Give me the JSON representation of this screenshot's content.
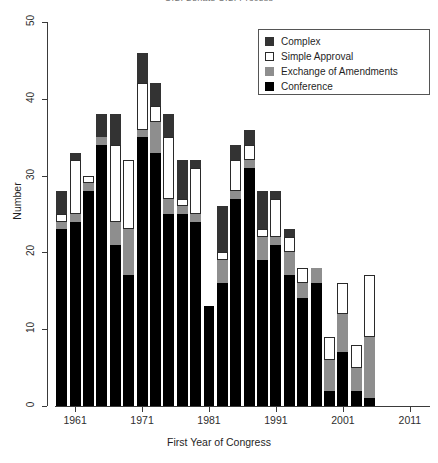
{
  "chart_data": {
    "type": "bar",
    "stacked": true,
    "title": "U.S. Senate U.S. Process",
    "xlabel": "First Year of Congress",
    "ylabel": "Number",
    "ylim": [
      0,
      50
    ],
    "yticks": [
      0,
      10,
      20,
      30,
      40,
      50
    ],
    "xticks": [
      1961,
      1971,
      1981,
      1991,
      2001,
      2011
    ],
    "grid": false,
    "legend_position": "top-right",
    "categories": [
      1959,
      1961,
      1963,
      1965,
      1967,
      1969,
      1971,
      1973,
      1975,
      1977,
      1979,
      1981,
      1983,
      1985,
      1987,
      1989,
      1991,
      1993,
      1995,
      1997,
      1999,
      2001,
      2003,
      2005,
      2007,
      2009,
      2011,
      2013
    ],
    "series": [
      {
        "name": "Conference",
        "color": "#000000",
        "values": [
          23,
          24,
          28,
          34,
          21,
          17,
          35,
          33,
          25,
          25,
          24,
          13,
          16,
          27,
          31,
          19,
          21,
          17,
          14,
          16,
          2,
          7,
          2,
          1,
          0,
          0,
          0,
          0
        ]
      },
      {
        "name": "Exchange of Amendments",
        "color": "#8e8e8e",
        "values": [
          1,
          1,
          1,
          1,
          3,
          6,
          1,
          4,
          2,
          1,
          1,
          0,
          3,
          1,
          1,
          3,
          1,
          3,
          2,
          2,
          4,
          5,
          3,
          8,
          0,
          0,
          0,
          0
        ]
      },
      {
        "name": "Simple Approval",
        "color": "#ffffff",
        "values": [
          1,
          7,
          1,
          0,
          10,
          9,
          6,
          2,
          8,
          1,
          6,
          0,
          1,
          4,
          2,
          1,
          5,
          2,
          2,
          0,
          3,
          4,
          3,
          8,
          0,
          0,
          0,
          0
        ]
      },
      {
        "name": "Complex",
        "color": "#333333",
        "values": [
          3,
          1,
          0,
          3,
          4,
          0,
          4,
          3,
          3,
          5,
          1,
          0,
          6,
          2,
          2,
          5,
          1,
          1,
          0,
          0,
          0,
          0,
          0,
          0,
          0,
          0,
          0,
          0
        ]
      }
    ],
    "totals": [
      28,
      33,
      30,
      38,
      38,
      32,
      46,
      42,
      38,
      32,
      32,
      13,
      26,
      34,
      36,
      28,
      28,
      23,
      18,
      18,
      9,
      16,
      8,
      17,
      0,
      0,
      0,
      0
    ]
  },
  "legend": {
    "items": [
      {
        "label": "Complex",
        "swatch": "complex-swatch"
      },
      {
        "label": "Simple Approval",
        "swatch": "simple-approval-swatch"
      },
      {
        "label": "Exchange of Amendments",
        "swatch": "exchange-swatch"
      },
      {
        "label": "Conference",
        "swatch": "conference-swatch"
      }
    ]
  },
  "axes": {
    "y_title": "Number",
    "x_title": "First Year of Congress",
    "y_labels": [
      "0",
      "10",
      "20",
      "30",
      "40",
      "50"
    ],
    "x_labels": [
      "1961",
      "1971",
      "1981",
      "1991",
      "2001",
      "2011"
    ]
  },
  "title": "U.S. Senate U.S. Process"
}
